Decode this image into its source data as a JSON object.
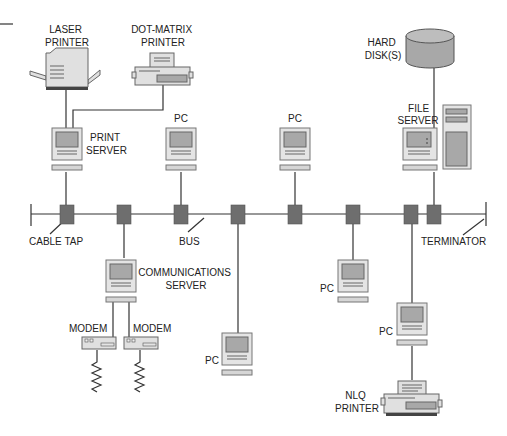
{
  "diagram": {
    "type": "bus-network-topology",
    "labels": {
      "laser_printer": [
        "LASER",
        "PRINTER"
      ],
      "dot_matrix_printer": [
        "DOT-MATRIX",
        "PRINTER"
      ],
      "print_server": [
        "PRINT",
        "SERVER"
      ],
      "pc_top_1": "PC",
      "pc_top_2": "PC",
      "hard_disks": [
        "HARD",
        "DISK(S)"
      ],
      "file_server": [
        "FILE",
        "SERVER"
      ],
      "cable_tap": "CABLE TAP",
      "bus": "BUS",
      "terminator": "TERMINATOR",
      "communications_server": [
        "COMMUNICATIONS",
        "SERVER"
      ],
      "modem_1": "MODEM",
      "modem_2": "MODEM",
      "pc_bottom_1": "PC",
      "pc_bottom_2": "PC",
      "pc_bottom_3": "PC",
      "nlq_printer": [
        "NLQ",
        "PRINTER"
      ]
    },
    "nodes": [
      {
        "id": "print-server",
        "type": "server",
        "connects_to": [
          "laser-printer",
          "dot-matrix-printer",
          "tap-1"
        ]
      },
      {
        "id": "pc-top-1",
        "type": "pc",
        "connects_to": [
          "tap-3"
        ]
      },
      {
        "id": "pc-top-2",
        "type": "pc",
        "connects_to": [
          "tap-5"
        ]
      },
      {
        "id": "file-server",
        "type": "server",
        "connects_to": [
          "hard-disks",
          "tap-8"
        ]
      },
      {
        "id": "communications-server",
        "type": "server",
        "connects_to": [
          "tap-2",
          "modem-1",
          "modem-2"
        ]
      },
      {
        "id": "pc-bottom-1",
        "type": "pc",
        "connects_to": [
          "tap-4"
        ]
      },
      {
        "id": "pc-bottom-2",
        "type": "pc",
        "connects_to": [
          "tap-6"
        ]
      },
      {
        "id": "pc-bottom-3",
        "type": "pc",
        "connects_to": [
          "tap-7",
          "nlq-printer"
        ]
      }
    ],
    "tap_count": 8,
    "colors": {
      "tap": "#6e6e6e",
      "case": "#e4e4e4",
      "screen": "#a8a8a8",
      "line": "#333333"
    }
  }
}
